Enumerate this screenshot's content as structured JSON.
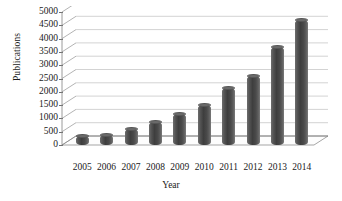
{
  "chart_data": {
    "type": "bar",
    "title": "",
    "subtitle": "",
    "xlabel": "Year",
    "ylabel": "Publications",
    "categories": [
      "2005",
      "2006",
      "2007",
      "2008",
      "2009",
      "2010",
      "2011",
      "2012",
      "2013",
      "2014"
    ],
    "values": [
      350,
      380,
      620,
      850,
      1150,
      1500,
      2150,
      2600,
      3700,
      4700
    ],
    "series": [
      {
        "name": "Publications",
        "values": [
          350,
          380,
          620,
          850,
          1150,
          1500,
          2150,
          2600,
          3700,
          4700
        ]
      }
    ],
    "ylim": [
      0,
      5000
    ],
    "ytick_labels": [
      "0",
      "500",
      "1000",
      "1500",
      "2000",
      "2500",
      "3000",
      "3500",
      "4000",
      "4500",
      "5000"
    ],
    "ytick_values": [
      0,
      500,
      1000,
      1500,
      2000,
      2500,
      3000,
      3500,
      4000,
      4500,
      5000
    ],
    "ytick_step": 500,
    "grid": true,
    "grid_axis": "y",
    "legend": false,
    "legend_position": "none",
    "style": "3d-cylinder",
    "bar_color": "#4a4a4a",
    "grid_color": "#b5b5b5",
    "axis_color": "#808080",
    "background_color": "#ffffff",
    "text_color": "#1a1a1a",
    "annotations": []
  }
}
